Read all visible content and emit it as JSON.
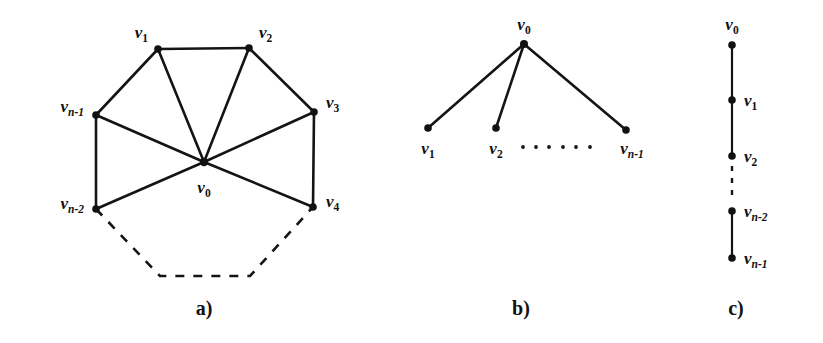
{
  "figure": {
    "background_color": "#ffffff",
    "ink_color": "#111111",
    "panels": [
      {
        "id": "a",
        "caption": "a)",
        "graph_type": "wheel",
        "description": "Wheel graph: hub v0 joined to every vertex of an outer cycle v1,v2,v3,v4,...,vn-2,vn-1",
        "vertices": [
          {
            "name": "v0",
            "label_main": "v",
            "label_sub": "0",
            "x": 204,
            "y": 162,
            "label_x": 204,
            "label_y": 193,
            "label_anchor": "middle"
          },
          {
            "name": "v1",
            "label_main": "v",
            "label_sub": "1",
            "x": 158,
            "y": 49,
            "label_x": 148,
            "label_y": 38,
            "label_anchor": "end"
          },
          {
            "name": "v2",
            "label_main": "v",
            "label_sub": "2",
            "x": 249,
            "y": 48,
            "label_x": 259,
            "label_y": 38,
            "label_anchor": "start"
          },
          {
            "name": "v3",
            "label_main": "v",
            "label_sub": "3",
            "x": 314,
            "y": 112,
            "label_x": 326,
            "label_y": 108,
            "label_anchor": "start"
          },
          {
            "name": "v4",
            "label_main": "v",
            "label_sub": "4",
            "x": 313,
            "y": 207,
            "label_x": 326,
            "label_y": 207,
            "label_anchor": "start"
          },
          {
            "name": "vn-2",
            "label_main": "v",
            "label_sub": "n-2",
            "x": 96,
            "y": 209,
            "label_x": 84,
            "label_y": 209,
            "label_anchor": "end"
          },
          {
            "name": "vn-1",
            "label_main": "v",
            "label_sub": "n-1",
            "x": 96,
            "y": 115,
            "label_x": 84,
            "label_y": 112,
            "label_anchor": "end"
          }
        ],
        "solid_edges": [
          [
            "v1",
            "v2"
          ],
          [
            "v2",
            "v3"
          ],
          [
            "v3",
            "v4"
          ],
          [
            "vn-2",
            "vn-1"
          ],
          [
            "vn-1",
            "v1"
          ],
          [
            "v0",
            "v1"
          ],
          [
            "v0",
            "v2"
          ],
          [
            "v0",
            "v3"
          ],
          [
            "v0",
            "v4"
          ],
          [
            "v0",
            "vn-2"
          ],
          [
            "v0",
            "vn-1"
          ]
        ],
        "dashed_path": [
          [
            96,
            209
          ],
          [
            160,
            276
          ],
          [
            250,
            276
          ],
          [
            313,
            207
          ]
        ],
        "caption_x": 204,
        "caption_y": 315
      },
      {
        "id": "b",
        "caption": "b)",
        "graph_type": "star",
        "description": "Star graph: centre v0 joined to leaves v1, v2, ..., vn-1",
        "vertices": [
          {
            "name": "v0",
            "label_main": "v",
            "label_sub": "0",
            "x": 524,
            "y": 44,
            "label_x": 524,
            "label_y": 30,
            "label_anchor": "middle"
          },
          {
            "name": "v1",
            "label_main": "v",
            "label_sub": "1",
            "x": 428,
            "y": 128,
            "label_x": 428,
            "label_y": 152,
            "label_anchor": "middle"
          },
          {
            "name": "v2",
            "label_main": "v",
            "label_sub": "2",
            "x": 496,
            "y": 128,
            "label_x": 496,
            "label_y": 152,
            "label_anchor": "middle"
          },
          {
            "name": "vn-1",
            "label_main": "v",
            "label_sub": "n-1",
            "x": 626,
            "y": 130,
            "label_x": 632,
            "label_y": 152,
            "label_anchor": "middle"
          }
        ],
        "solid_edges": [
          [
            "v0",
            "v1"
          ],
          [
            "v0",
            "v2"
          ],
          [
            "v0",
            "vn-1"
          ]
        ],
        "ellipsis": {
          "count": 6,
          "x_start": 523,
          "x_end": 590,
          "y": 147,
          "radius": 1.9
        },
        "caption_x": 521,
        "caption_y": 315
      },
      {
        "id": "c",
        "caption": "c)",
        "graph_type": "path",
        "description": "Path graph: v0 - v1 - v2 - ... - vn-2 - vn-1 drawn vertically",
        "vertices": [
          {
            "name": "v0",
            "label_main": "v",
            "label_sub": "0",
            "x": 732,
            "y": 45,
            "label_x": 732,
            "label_y": 30,
            "label_anchor": "middle"
          },
          {
            "name": "v1",
            "label_main": "v",
            "label_sub": "1",
            "x": 732,
            "y": 100,
            "label_x": 744,
            "label_y": 105,
            "label_anchor": "start"
          },
          {
            "name": "v2",
            "label_main": "v",
            "label_sub": "2",
            "x": 732,
            "y": 156,
            "label_x": 744,
            "label_y": 161,
            "label_anchor": "start"
          },
          {
            "name": "vn-2",
            "label_main": "v",
            "label_sub": "n-2",
            "x": 732,
            "y": 211,
            "label_x": 744,
            "label_y": 216,
            "label_anchor": "start"
          },
          {
            "name": "vn-1",
            "label_main": "v",
            "label_sub": "n-1",
            "x": 732,
            "y": 258,
            "label_x": 744,
            "label_y": 263,
            "label_anchor": "start"
          }
        ],
        "solid_edges": [
          [
            "v0",
            "v1"
          ],
          [
            "v1",
            "v2"
          ],
          [
            "vn-2",
            "vn-1"
          ]
        ],
        "dashed_segment": {
          "x": 732,
          "y1": 164,
          "y2": 203
        },
        "caption_x": 736,
        "caption_y": 315
      }
    ],
    "vertex_radius": 3.6
  }
}
